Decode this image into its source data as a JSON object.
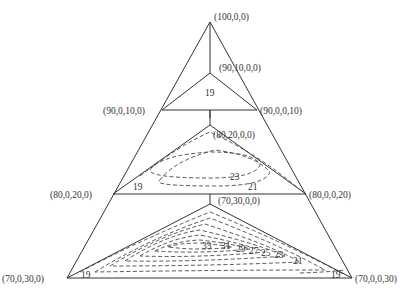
{
  "diagram": {
    "type": "quaternary composition section diagram (stacked ternary slices)",
    "vertex_labels": {
      "apex": "(100,0,0)",
      "slice1_inner": "(90,10,0,0)",
      "slice1_left": "(90,0,10,0)",
      "slice1_right": "(90,0,0,10)",
      "slice2_inner": "(80,20,0,0)",
      "slice2_left": "(80,0,20,0)",
      "slice2_right": "(80,0,0,20)",
      "slice3_inner": "(70,30,0,0)",
      "slice3_left": "(70,0,30,0)",
      "slice3_right": "(70,0,0,30)"
    },
    "contour_labels": {
      "slice1": [
        "19"
      ],
      "slice2": [
        "19",
        "21",
        "23"
      ],
      "slice3": [
        "19",
        "33",
        "31",
        "29",
        "27",
        "25",
        "23",
        "21",
        "19"
      ]
    }
  }
}
